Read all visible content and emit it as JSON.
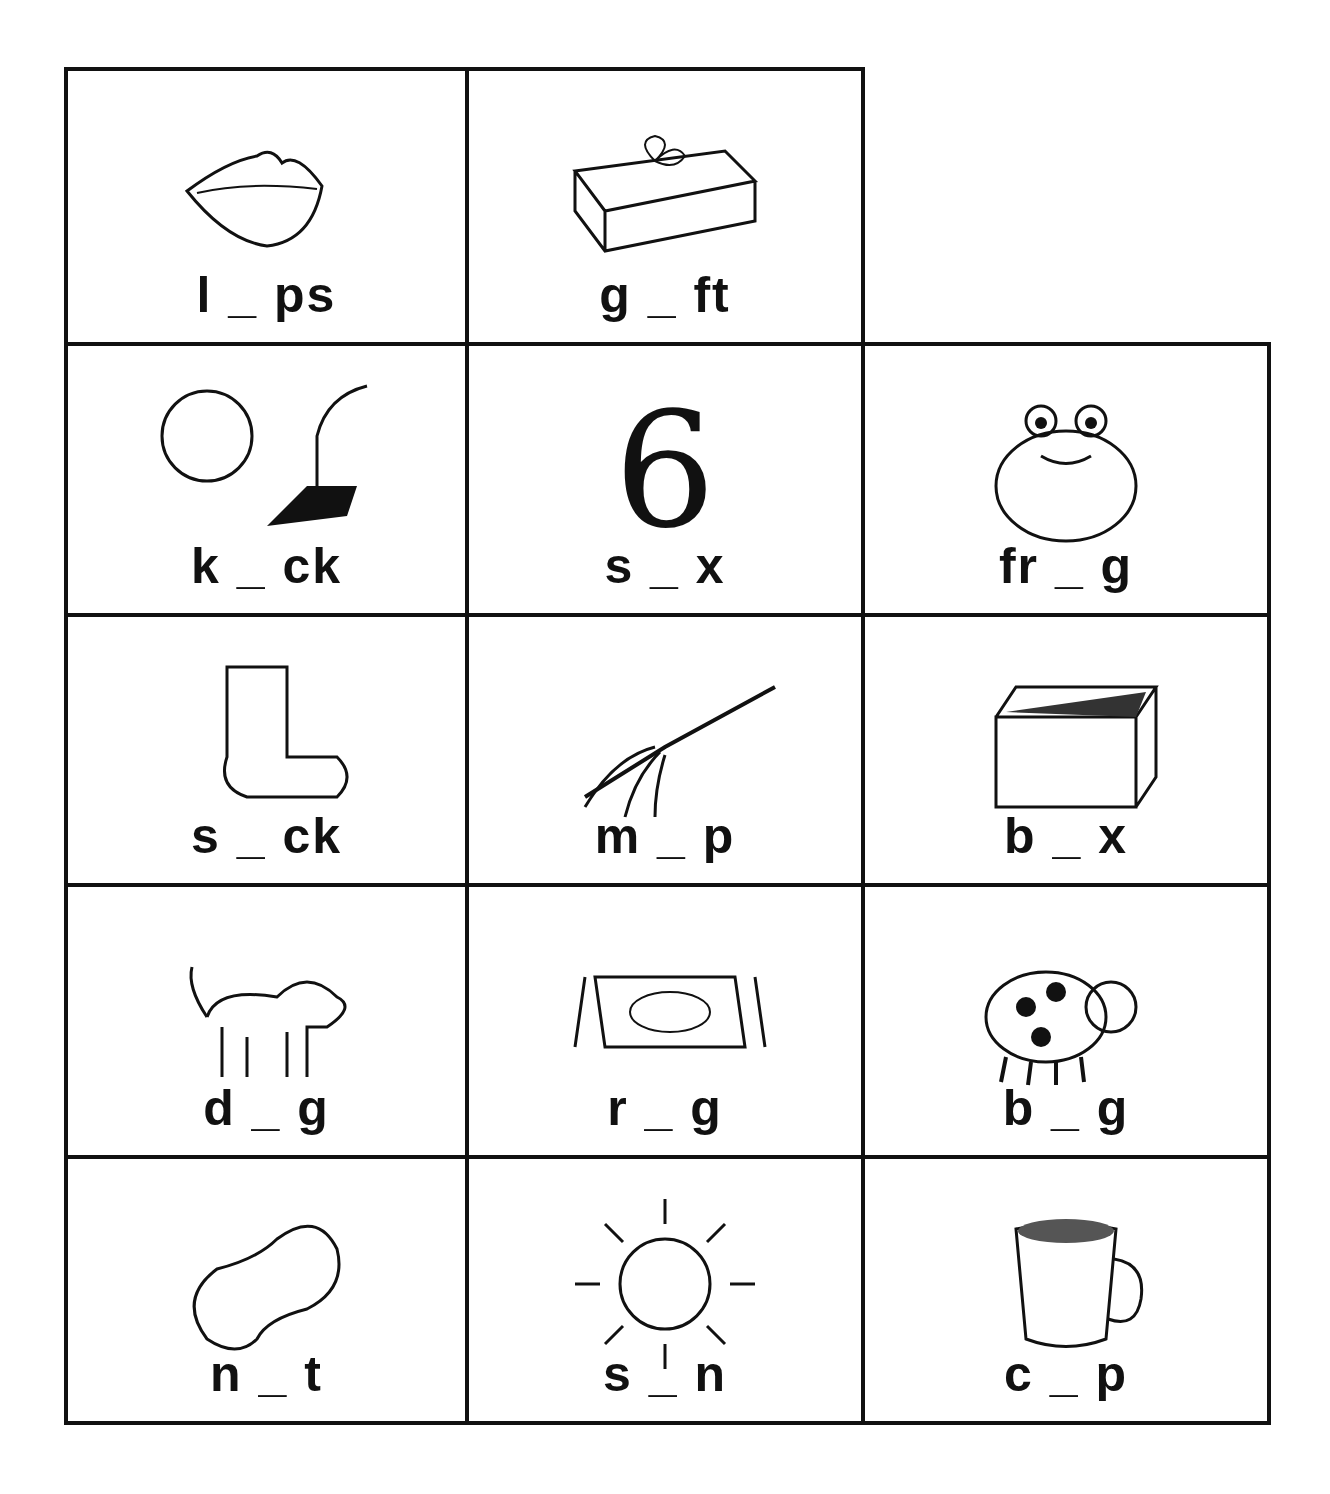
{
  "worksheet": {
    "cells": [
      {
        "row": 0,
        "col": 0,
        "word": "l _ ps",
        "picture": "lips"
      },
      {
        "row": 0,
        "col": 1,
        "word": "g _ ft",
        "picture": "gift"
      },
      {
        "row": 1,
        "col": 0,
        "word": "k _ ck",
        "picture": "kick"
      },
      {
        "row": 1,
        "col": 1,
        "word": "s _ x",
        "picture": "six"
      },
      {
        "row": 1,
        "col": 2,
        "word": "fr _ g",
        "picture": "frog"
      },
      {
        "row": 2,
        "col": 0,
        "word": "s _ ck",
        "picture": "sock"
      },
      {
        "row": 2,
        "col": 1,
        "word": "m _ p",
        "picture": "mop"
      },
      {
        "row": 2,
        "col": 2,
        "word": "b _ x",
        "picture": "box"
      },
      {
        "row": 3,
        "col": 0,
        "word": "d _ g",
        "picture": "dog"
      },
      {
        "row": 3,
        "col": 1,
        "word": "r _ g",
        "picture": "rug"
      },
      {
        "row": 3,
        "col": 2,
        "word": "b _ g",
        "picture": "bug"
      },
      {
        "row": 4,
        "col": 0,
        "word": "n _ t",
        "picture": "nut"
      },
      {
        "row": 4,
        "col": 1,
        "word": "s _ n",
        "picture": "sun"
      },
      {
        "row": 4,
        "col": 2,
        "word": "c _ p",
        "picture": "cup"
      }
    ]
  }
}
